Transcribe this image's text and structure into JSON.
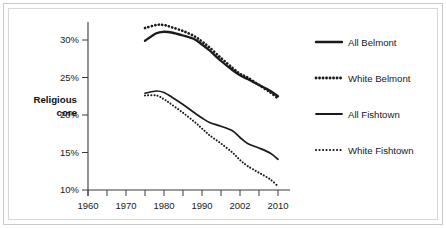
{
  "figure": {
    "background": "#ffffff",
    "border_color": "#c9c9c9",
    "axis_color": "#3a3a3a",
    "series_color": "#1a1a1a"
  },
  "chart_data": {
    "type": "line",
    "title": "",
    "xlabel": "",
    "ylabel": "Religious core",
    "xlim": [
      1960,
      2010
    ],
    "ylim": [
      9,
      33
    ],
    "grid": false,
    "legend_position": "right",
    "x_ticks": [
      1960,
      1970,
      1980,
      1990,
      2000,
      2010
    ],
    "x_tick_labels": [
      "1960",
      "1970",
      "1980",
      "1990",
      "2002",
      "2010"
    ],
    "x_minor_ticks": [
      1965,
      1975,
      1985,
      1995,
      2005
    ],
    "y_ticks": [
      10,
      15,
      20,
      25,
      30
    ],
    "y_tick_labels": [
      "10%",
      "15%",
      "20%",
      "25%",
      "30%"
    ],
    "series": [
      {
        "name": "All Belmont",
        "style": "solid",
        "weight": "thick",
        "x": [
          1975,
          1978,
          1980,
          1982,
          1985,
          1988,
          1990,
          1992,
          1995,
          1998,
          2000,
          2002,
          2005,
          2008,
          2010
        ],
        "values": [
          29.9,
          30.9,
          31.1,
          31.0,
          30.6,
          30.1,
          29.4,
          28.6,
          27.2,
          26.0,
          25.3,
          24.8,
          24.0,
          23.2,
          22.5
        ]
      },
      {
        "name": "White Belmont",
        "style": "dotted",
        "weight": "thick",
        "x": [
          1975,
          1978,
          1980,
          1982,
          1985,
          1988,
          1990,
          1992,
          1995,
          1998,
          2000,
          2002,
          2005,
          2008,
          2010
        ],
        "values": [
          31.6,
          32.0,
          32.0,
          31.7,
          31.2,
          30.5,
          29.8,
          29.0,
          27.6,
          26.3,
          25.5,
          25.0,
          24.0,
          23.0,
          22.2
        ]
      },
      {
        "name": "All Fishtown",
        "style": "solid",
        "weight": "thin",
        "x": [
          1975,
          1978,
          1980,
          1982,
          1985,
          1988,
          1990,
          1992,
          1995,
          1998,
          2000,
          2002,
          2005,
          2008,
          2010
        ],
        "values": [
          22.9,
          23.2,
          23.0,
          22.4,
          21.4,
          20.3,
          19.6,
          19.0,
          18.5,
          17.9,
          17.0,
          16.2,
          15.6,
          14.9,
          14.1
        ]
      },
      {
        "name": "White Fishtown",
        "style": "dotted",
        "weight": "thin",
        "x": [
          1975,
          1978,
          1980,
          1982,
          1985,
          1988,
          1990,
          1992,
          1995,
          1998,
          2000,
          2002,
          2005,
          2008,
          2010
        ],
        "values": [
          22.6,
          22.6,
          22.1,
          21.4,
          20.3,
          19.1,
          18.2,
          17.3,
          16.2,
          15.0,
          14.0,
          13.2,
          12.3,
          11.4,
          10.5
        ]
      }
    ]
  },
  "legend": {
    "items": [
      {
        "label": "All Belmont",
        "style": "solid",
        "weight": "thick"
      },
      {
        "label": "White Belmont",
        "style": "dotted",
        "weight": "thick"
      },
      {
        "label": "All Fishtown",
        "style": "solid",
        "weight": "thin"
      },
      {
        "label": "White Fishtown",
        "style": "dotted",
        "weight": "thin"
      }
    ]
  },
  "axis": {
    "y_title_line1": "Religious",
    "y_title_line2": "core"
  }
}
